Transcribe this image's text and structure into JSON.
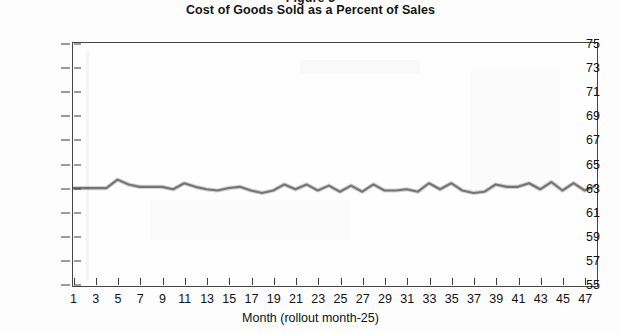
{
  "header": {
    "figure_label_partial": "Figure 3",
    "title": "Cost of Goods Sold as a Percent of Sales"
  },
  "chart_data": {
    "type": "line",
    "title": "Cost of Goods Sold as a Percent of Sales",
    "xlabel": "Month (rollout month-25)",
    "ylabel": "",
    "xlim": [
      1,
      48
    ],
    "ylim": [
      55,
      75
    ],
    "grid": false,
    "legend": null,
    "y_ticks": [
      75,
      73,
      71,
      69,
      67,
      65,
      63,
      61,
      59,
      57,
      55
    ],
    "x_ticks": [
      1,
      3,
      5,
      7,
      9,
      11,
      13,
      15,
      17,
      19,
      21,
      23,
      25,
      27,
      29,
      31,
      33,
      35,
      37,
      39,
      41,
      43,
      45,
      47
    ],
    "line_color": "#6d6d6d",
    "x": [
      1,
      2,
      3,
      4,
      5,
      6,
      7,
      8,
      9,
      10,
      11,
      12,
      13,
      14,
      15,
      16,
      17,
      18,
      19,
      20,
      21,
      22,
      23,
      24,
      25,
      26,
      27,
      28,
      29,
      30,
      31,
      32,
      33,
      34,
      35,
      36,
      37,
      38,
      39,
      40,
      41,
      42,
      43,
      44,
      45,
      46,
      47,
      48
    ],
    "values": [
      63.0,
      63.0,
      63.0,
      63.0,
      63.7,
      63.3,
      63.1,
      63.1,
      63.1,
      62.9,
      63.4,
      63.1,
      62.9,
      62.8,
      63.0,
      63.1,
      62.8,
      62.6,
      62.8,
      63.3,
      62.9,
      63.3,
      62.8,
      63.2,
      62.7,
      63.2,
      62.7,
      63.3,
      62.8,
      62.8,
      62.9,
      62.7,
      63.4,
      62.9,
      63.4,
      62.8,
      62.6,
      62.7,
      63.3,
      63.1,
      63.1,
      63.4,
      62.9,
      63.5,
      62.8,
      63.4,
      62.8,
      63.2
    ],
    "series": [
      {
        "name": "Cost of goods sold (% of sales)",
        "values": [
          63.0,
          63.0,
          63.0,
          63.0,
          63.7,
          63.3,
          63.1,
          63.1,
          63.1,
          62.9,
          63.4,
          63.1,
          62.9,
          62.8,
          63.0,
          63.1,
          62.8,
          62.6,
          62.8,
          63.3,
          62.9,
          63.3,
          62.8,
          63.2,
          62.7,
          63.2,
          62.7,
          63.3,
          62.8,
          62.8,
          62.9,
          62.7,
          63.4,
          62.9,
          63.4,
          62.8,
          62.6,
          62.7,
          63.3,
          63.1,
          63.1,
          63.4,
          62.9,
          63.5,
          62.8,
          63.4,
          62.8,
          63.2
        ]
      }
    ]
  }
}
